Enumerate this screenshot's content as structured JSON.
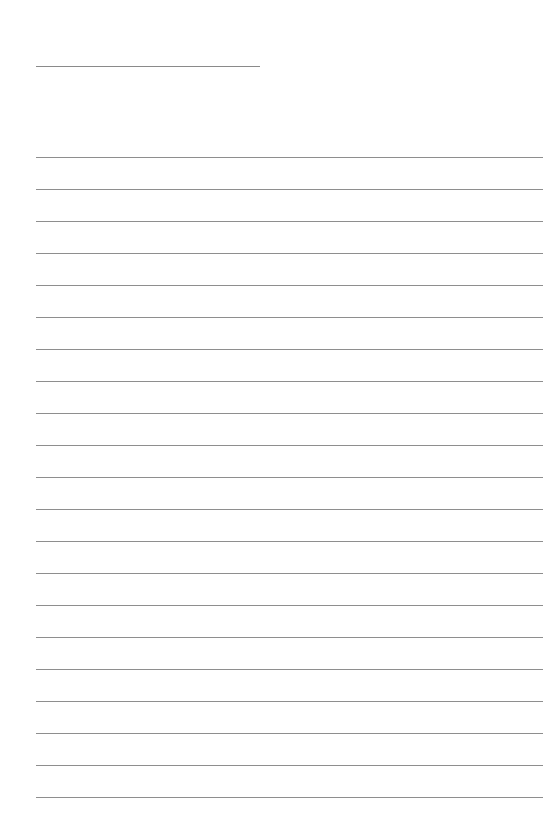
{
  "page": {
    "type": "blank lined paper",
    "background_color": "#ffffff",
    "line_color": "#8e8e8e"
  },
  "title_line": {
    "label": ""
  },
  "ruled_lines": {
    "count": 21,
    "first_y": 157,
    "spacing": 32,
    "entries": [
      "",
      "",
      "",
      "",
      "",
      "",
      "",
      "",
      "",
      "",
      "",
      "",
      "",
      "",
      "",
      "",
      "",
      "",
      "",
      "",
      ""
    ]
  }
}
